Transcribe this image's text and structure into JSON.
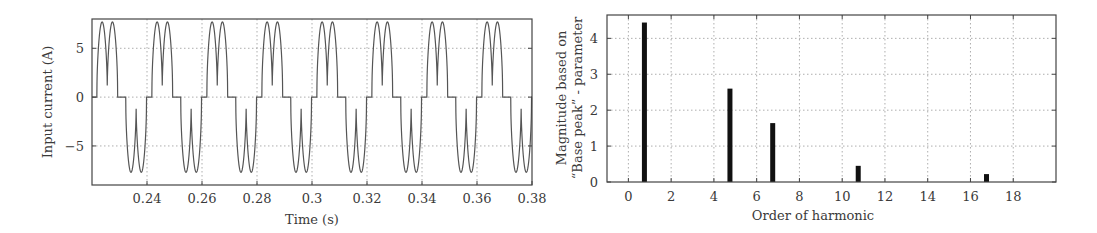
{
  "chart_data": [
    {
      "type": "line",
      "title": "",
      "xlabel": "Time (s)",
      "ylabel": "Input current (A)",
      "xlim": [
        0.22,
        0.38
      ],
      "ylim": [
        -9,
        8
      ],
      "xticks": [
        0.24,
        0.26,
        0.28,
        0.3,
        0.32,
        0.34,
        0.36,
        0.38
      ],
      "xtick_labels": [
        "0.24",
        "0.26",
        "0.28",
        "0.3",
        "0.32",
        "0.34",
        "0.36",
        "0.38"
      ],
      "yticks": [
        -5,
        0,
        5
      ],
      "ytick_labels": [
        "−5",
        "0",
        "5"
      ],
      "grid": true,
      "legend": null,
      "series": [
        {
          "name": "Input current",
          "description": "Periodic 50 Hz quasi-square current: each half-cycle is a pulse (~0.0075 s wide) with two humps peaking ~7.7 A and a dip ~1 A, separated by zero-current intervals; negative half-cycle mirrors the positive one.",
          "period_s": 0.02,
          "first_positive_pulse_start_s": 0.2218,
          "pulse_width_s": 0.0075,
          "negative_pulse_offset_s": 0.0105,
          "peak_A": 7.7,
          "dip_A": 1.0,
          "edge_step_A": 0.0
        }
      ]
    },
    {
      "type": "bar",
      "title": "",
      "xlabel": "Order of harmonic",
      "ylabel": "Magnitude based on “Base peak” - parameter",
      "ylabel_lines": [
        "Magnitude based on",
        "“Base peak” - parameter"
      ],
      "xlim": [
        -1,
        20
      ],
      "ylim": [
        0,
        4.65
      ],
      "xticks": [
        0,
        2,
        4,
        6,
        8,
        10,
        12,
        14,
        16,
        18
      ],
      "xtick_labels": [
        "0",
        "2",
        "4",
        "6",
        "8",
        "10",
        "12",
        "14",
        "16",
        "18"
      ],
      "yticks": [
        0,
        1,
        2,
        3,
        4
      ],
      "ytick_labels": [
        "0",
        "1",
        "2",
        "3",
        "4"
      ],
      "grid": true,
      "legend": null,
      "x": [
        0.75,
        4.75,
        6.75,
        10.75,
        16.75
      ],
      "harmonic_order": [
        1,
        5,
        7,
        11,
        17
      ],
      "values": [
        4.44,
        2.6,
        1.64,
        0.45,
        0.22
      ]
    }
  ]
}
